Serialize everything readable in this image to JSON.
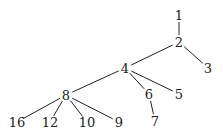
{
  "diagram": {
    "type": "tree",
    "nodes": [
      {
        "id": "1",
        "label": "1",
        "x": 179,
        "y": 15
      },
      {
        "id": "2",
        "label": "2",
        "x": 179,
        "y": 42
      },
      {
        "id": "3",
        "label": "3",
        "x": 208,
        "y": 68
      },
      {
        "id": "4",
        "label": "4",
        "x": 125,
        "y": 68
      },
      {
        "id": "5",
        "label": "5",
        "x": 179,
        "y": 94
      },
      {
        "id": "6",
        "label": "6",
        "x": 149,
        "y": 94
      },
      {
        "id": "7",
        "label": "7",
        "x": 155,
        "y": 121
      },
      {
        "id": "8",
        "label": "8",
        "x": 66,
        "y": 95
      },
      {
        "id": "16",
        "label": "16",
        "x": 17,
        "y": 122
      },
      {
        "id": "12",
        "label": "12",
        "x": 50,
        "y": 122
      },
      {
        "id": "10",
        "label": "10",
        "x": 87,
        "y": 122
      },
      {
        "id": "9",
        "label": "9",
        "x": 119,
        "y": 122
      }
    ],
    "edges": [
      {
        "from": "1",
        "to": "2"
      },
      {
        "from": "2",
        "to": "3"
      },
      {
        "from": "2",
        "to": "4"
      },
      {
        "from": "4",
        "to": "5"
      },
      {
        "from": "4",
        "to": "6"
      },
      {
        "from": "6",
        "to": "7"
      },
      {
        "from": "4",
        "to": "8"
      },
      {
        "from": "8",
        "to": "16"
      },
      {
        "from": "8",
        "to": "12"
      },
      {
        "from": "8",
        "to": "10"
      },
      {
        "from": "8",
        "to": "9"
      }
    ]
  }
}
